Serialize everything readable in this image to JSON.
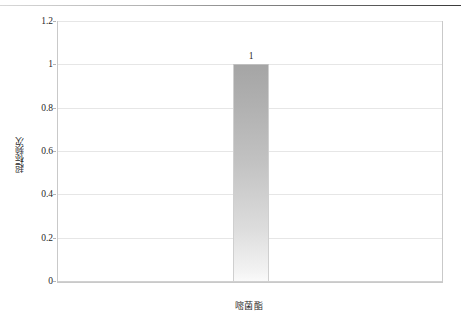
{
  "chart_data": {
    "type": "bar",
    "title": "",
    "subtitle": "",
    "xlabel": "",
    "ylabel": "超标频次",
    "categories": [
      "嘧菌酯"
    ],
    "values": [
      1
    ],
    "data_labels": [
      "1"
    ],
    "ylim": [
      0,
      1.2
    ],
    "y_ticks": [
      0,
      0.2,
      0.4,
      0.6,
      0.8,
      1,
      1.2
    ],
    "y_tick_labels": [
      "0",
      "0.2",
      "0.4",
      "0.6",
      "0.8",
      "1",
      "1.2"
    ],
    "grid": true,
    "grid_axis": "y",
    "legend": false,
    "legend_position": "none",
    "series": [
      {
        "name": "超标频次",
        "values": [
          1
        ]
      }
    ]
  },
  "colors": {
    "bar_top": "#a5a5a5",
    "bar_bottom": "#fafafa",
    "gridline": "#e6e6e6",
    "plot_border": "#c9c9c9",
    "axis_text": "#1f1f1f",
    "title_rule": "#3a3a3a",
    "background": "#ffffff"
  }
}
